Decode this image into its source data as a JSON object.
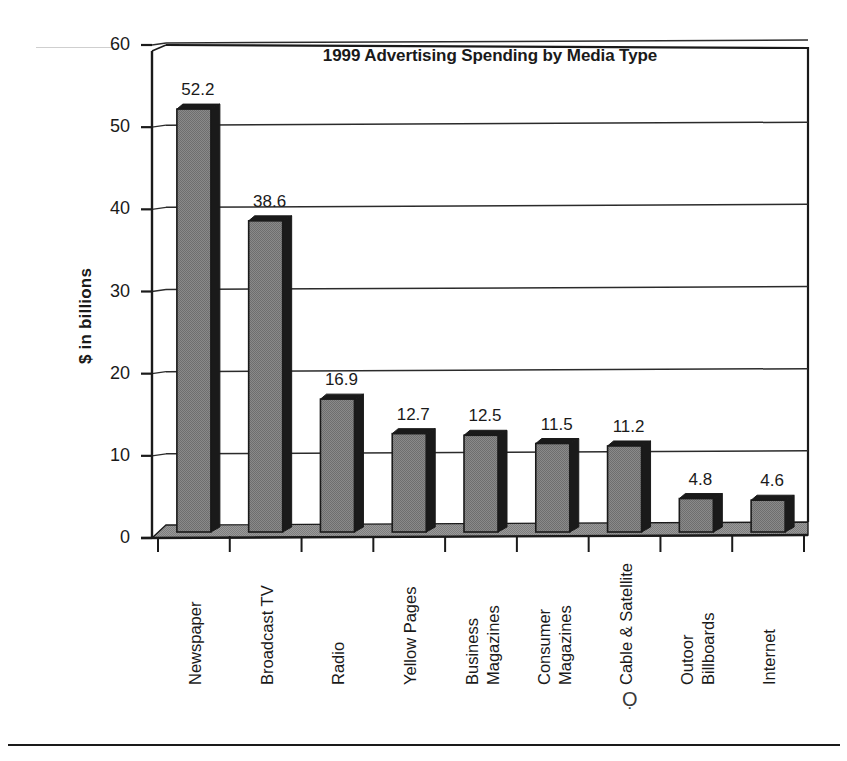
{
  "chart_data": {
    "type": "bar",
    "title": "1999 Advertising Spending by Media Type",
    "xlabel": "",
    "ylabel": "$ in billions",
    "ylim": [
      0,
      60
    ],
    "yticks": [
      "0",
      "10",
      "20",
      "30",
      "40",
      "50",
      "60"
    ],
    "grid": true,
    "grid_axis": "y",
    "legend": "none",
    "orientation": "vertical",
    "style": "3d-shadow-bars",
    "bar_color": "#808080",
    "bar_edge_color": "#1a1a1a",
    "categories": [
      "Newspaper",
      "Broadcast TV",
      "Radio",
      "Yellow Pages",
      "Business Magazines",
      "Consumer Magazines",
      "Cable & Satellite",
      "Outoor Billboards",
      "Internet"
    ],
    "category_label_lines": [
      [
        "Newspaper"
      ],
      [
        "Broadcast TV"
      ],
      [
        "Radio"
      ],
      [
        "Yellow Pages"
      ],
      [
        "Business",
        "Magazines"
      ],
      [
        "Consumer",
        "Magazines"
      ],
      [
        "Cable & Satellite"
      ],
      [
        "Outoor",
        "Billboards"
      ],
      [
        "Internet"
      ]
    ],
    "values": [
      52.2,
      38.6,
      16.9,
      12.7,
      12.5,
      11.5,
      11.2,
      4.8,
      4.6
    ],
    "data_labels": [
      "52.2",
      "38.6",
      "16.9",
      "12.7",
      "12.5",
      "11.5",
      "11.2",
      "4.8",
      "4.6"
    ]
  },
  "colors": {
    "bar_fill": "#808080",
    "bar_shadow": "#1a1a1a",
    "axis": "#1a1a1a",
    "grid": "#2b2b2b",
    "floor": "#9a9a9a",
    "faint_rule": "#cfcfcf",
    "text": "#1a1a1a",
    "background": "#ffffff"
  },
  "page": {
    "bottom_rule": true,
    "smudge_glyph": "Ọ"
  }
}
